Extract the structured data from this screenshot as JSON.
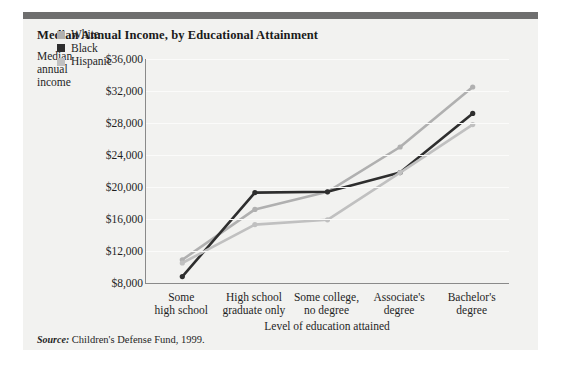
{
  "figure": {
    "title": "Median Annual Income, by Educational Attainment",
    "source_prefix": "Source:",
    "source_text": "Children's Defense Fund, 1999.",
    "background_color": "#f2f2f0",
    "topbar_color": "#6e6e6e",
    "axis_color": "#8a8a8a"
  },
  "chart_data": {
    "type": "line",
    "title": "Median Annual Income, by Educational Attainment",
    "xlabel": "Level of education attained",
    "ylabel": "Median annual income",
    "ylabel_lines": [
      "Median",
      "annual",
      "income"
    ],
    "categories": [
      "Some high school",
      "High school graduate only",
      "Some college, no degree",
      "Associate's degree",
      "Bachelor's degree"
    ],
    "category_lines": [
      [
        "Some",
        "high school"
      ],
      [
        "High school",
        "graduate only"
      ],
      [
        "Some college,",
        "no degree"
      ],
      [
        "Associate's",
        "degree"
      ],
      [
        "Bachelor's",
        "degree"
      ]
    ],
    "series": [
      {
        "name": "White",
        "color": "#b0b0b0",
        "values": [
          10900,
          17200,
          19400,
          25000,
          32500
        ]
      },
      {
        "name": "Black",
        "color": "#2e2e2e",
        "values": [
          8800,
          19300,
          19400,
          21800,
          29200
        ]
      },
      {
        "name": "Hispanic",
        "color": "#c0c0c0",
        "values": [
          10500,
          15300,
          15900,
          21800,
          27800
        ]
      }
    ],
    "ylim": [
      8000,
      36000
    ],
    "yticks": [
      8000,
      12000,
      16000,
      20000,
      24000,
      28000,
      32000,
      36000
    ],
    "ytick_labels": [
      "$8,000",
      "$12,000",
      "$16,000",
      "$20,000",
      "$24,000",
      "$28,000",
      "$32,000",
      "$36,000"
    ],
    "grid": true,
    "legend_position": "top-left",
    "legend": [
      "White",
      "Black",
      "Hispanic"
    ]
  }
}
